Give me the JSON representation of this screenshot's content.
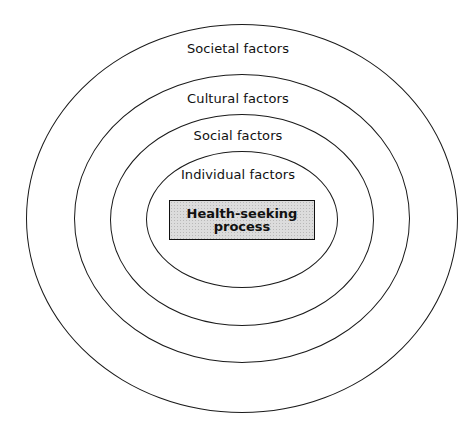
{
  "diagram": {
    "type": "concentric-ellipses",
    "rings": [
      {
        "id": "societal",
        "label": "Societal factors",
        "left": 26,
        "top": 24,
        "width": 432,
        "height": 389,
        "label_top": 41
      },
      {
        "id": "cultural",
        "label": "Cultural factors",
        "left": 74,
        "top": 74,
        "width": 336,
        "height": 289,
        "label_top": 91
      },
      {
        "id": "social",
        "label": "Social factors",
        "left": 110,
        "top": 114,
        "width": 264,
        "height": 212,
        "label_top": 128
      },
      {
        "id": "individual",
        "label": "Individual factors",
        "left": 146,
        "top": 151,
        "width": 192,
        "height": 137,
        "label_top": 167
      }
    ],
    "core": {
      "line1": "Health-seeking",
      "line2": "process"
    },
    "colors": {
      "stroke": "#1a1a1a",
      "core_fill": "#dcdcdc",
      "background": "#ffffff"
    }
  }
}
